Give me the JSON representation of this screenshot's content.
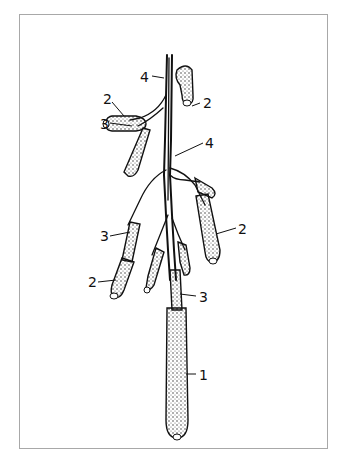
{
  "figure": {
    "frame_color": "#a8a8a8",
    "ink_color": "#111111",
    "labels": [
      {
        "id": "l4a",
        "text": "4",
        "x": 140,
        "y": 70
      },
      {
        "id": "l2a",
        "text": "2",
        "x": 103,
        "y": 92
      },
      {
        "id": "l2b",
        "text": "2",
        "x": 206,
        "y": 96
      },
      {
        "id": "l3a",
        "text": "3",
        "x": 100,
        "y": 117
      },
      {
        "id": "l4b",
        "text": "4",
        "x": 205,
        "y": 136
      },
      {
        "id": "l3b",
        "text": "3",
        "x": 100,
        "y": 229
      },
      {
        "id": "l2c",
        "text": "2",
        "x": 238,
        "y": 222
      },
      {
        "id": "l2d",
        "text": "2",
        "x": 88,
        "y": 275
      },
      {
        "id": "l3c",
        "text": "3",
        "x": 199,
        "y": 290
      },
      {
        "id": "l1",
        "text": "1",
        "x": 199,
        "y": 368
      }
    ]
  }
}
